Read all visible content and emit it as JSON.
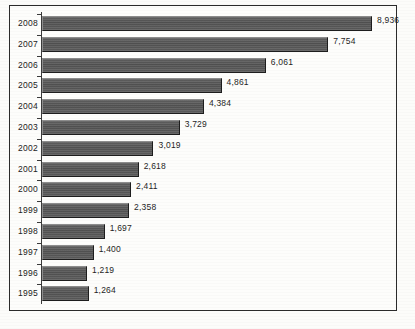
{
  "chart_data": {
    "type": "bar",
    "orientation": "horizontal",
    "title": "",
    "subtitle": "",
    "xlabel": "",
    "ylabel": "",
    "grid": false,
    "legend": false,
    "legend_position": "none",
    "xlim": [
      0,
      9500
    ],
    "categories": [
      "2008",
      "2007",
      "2006",
      "2005",
      "2004",
      "2003",
      "2002",
      "2001",
      "2000",
      "1999",
      "1998",
      "1997",
      "1996",
      "1995"
    ],
    "values": [
      8936,
      7754,
      6061,
      4861,
      4384,
      3729,
      3019,
      2618,
      2411,
      2358,
      1697,
      1400,
      1219,
      1264
    ],
    "value_labels": [
      "8,936",
      "7,754",
      "6,061",
      "4,861",
      "4,384",
      "3,729",
      "3,019",
      "2,618",
      "2,411",
      "2,358",
      "1,697",
      "1,400",
      "1,219",
      "1,264"
    ],
    "series": [
      {
        "name": "",
        "values": [
          8936,
          7754,
          6061,
          4861,
          4384,
          3729,
          3019,
          2618,
          2411,
          2358,
          1697,
          1400,
          1219,
          1264
        ]
      }
    ]
  },
  "style": {
    "bar_color": "#545454",
    "bar_highlight": "#8d8d8d",
    "bar_shadow": "#1d1d1d",
    "frame_color": "#2b2b2b",
    "axis_color": "#3a3a3a",
    "text_color": "#1f1f1f",
    "background": "#fdfdfb"
  }
}
